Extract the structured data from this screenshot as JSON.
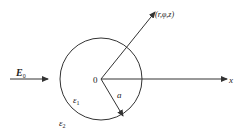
{
  "diagram": {
    "type": "dielectric-cylinder-in-uniform-field",
    "colors": {
      "stroke": "#333333",
      "text": "#222222",
      "background": "#ffffff"
    },
    "labels": {
      "field": "E",
      "field_subscript": "0",
      "origin": "0",
      "point": "(r,φ,z)",
      "radius": "a",
      "x_axis": "x",
      "inner_medium": "ε",
      "inner_medium_subscript": "1",
      "outer_medium": "ε",
      "outer_medium_subscript": "2"
    }
  }
}
